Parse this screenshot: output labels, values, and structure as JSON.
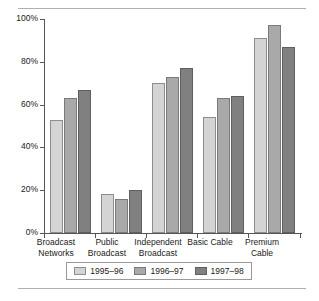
{
  "chart_data": {
    "type": "bar",
    "title": "",
    "subtitle": "",
    "xlabel": "",
    "ylabel": "",
    "ylim": [
      0,
      100
    ],
    "ytick_labels": [
      "0%",
      "20%",
      "40%",
      "60%",
      "80%",
      "100%"
    ],
    "ytick_values": [
      0,
      20,
      40,
      60,
      80,
      100
    ],
    "grid": false,
    "legend_position": "bottom",
    "categories": [
      "Broadcast\nNetworks",
      "Public\nBroadcast",
      "Independent\nBroadcast",
      "Basic Cable",
      "Premium\nCable"
    ],
    "series": [
      {
        "name": "1995–96",
        "color": "#d4d4d4",
        "values": [
          53,
          18,
          70,
          54,
          91
        ]
      },
      {
        "name": "1996–97",
        "color": "#a9a9a9",
        "values": [
          63,
          16,
          73,
          63,
          97
        ]
      },
      {
        "name": "1997–98",
        "color": "#808080",
        "values": [
          67,
          20,
          77,
          64,
          87
        ]
      }
    ]
  },
  "legend": {
    "items": [
      {
        "label": "1995–96"
      },
      {
        "label": "1996–97"
      },
      {
        "label": "1997–98"
      }
    ]
  }
}
